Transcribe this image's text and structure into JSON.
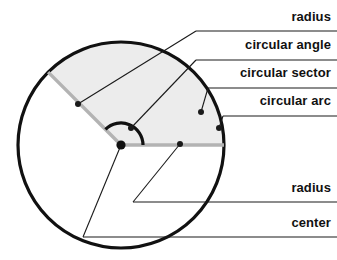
{
  "figure": {
    "type": "geometry-diagram",
    "background_color": "#ffffff"
  },
  "geometry": {
    "circle": {
      "center_x": 121,
      "center_y": 145,
      "radius": 103,
      "stroke_color": "#111111",
      "stroke_width": 3.2,
      "fill_color": "#ffffff"
    },
    "sector": {
      "fill_color": "#ececec",
      "start_angle_deg": 135,
      "end_angle_deg": 0,
      "radius_stroke_color": "#b3b3b3",
      "radius_stroke_width": 3.4
    },
    "angle_arc": {
      "radius": 22,
      "stroke_color": "#111111",
      "stroke_width": 3.2,
      "start_angle_deg": 135,
      "end_angle_deg": 0
    },
    "center_dot": {
      "x": 121,
      "y": 145,
      "r": 4.6,
      "color": "#111111"
    },
    "leader_color": "#1a1a1a",
    "leader_width": 1.1,
    "marker_dot_radius": 3.0
  },
  "labels": [
    {
      "id": "radius-upper",
      "text": "radius",
      "text_x": 331,
      "text_y": 10,
      "rule_y": 31,
      "rule_x1": 196,
      "rule_x2": 337,
      "anchor_x": 78,
      "anchor_y": 104
    },
    {
      "id": "circular-angle",
      "text": "circular angle",
      "text_x": 331,
      "text_y": 38,
      "rule_y": 60,
      "rule_x1": 196,
      "rule_x2": 337,
      "anchor_x": 131,
      "anchor_y": 128
    },
    {
      "id": "circular-sector",
      "text": "circular sector",
      "text_x": 331,
      "text_y": 66,
      "rule_y": 88,
      "rule_x1": 208,
      "rule_x2": 337,
      "anchor_x": 201,
      "anchor_y": 112
    },
    {
      "id": "circular-arc",
      "text": "circular arc",
      "text_x": 331,
      "text_y": 94,
      "rule_y": 116,
      "rule_x1": 223,
      "rule_x2": 337,
      "anchor_x": 219,
      "anchor_y": 128
    },
    {
      "id": "radius-lower",
      "text": "radius",
      "text_x": 331,
      "text_y": 181,
      "rule_y": 202,
      "rule_x1": 133,
      "rule_x2": 337,
      "anchor_x": 180,
      "anchor_y": 144
    },
    {
      "id": "center",
      "text": "center",
      "text_x": 331,
      "text_y": 216,
      "rule_y": 237,
      "rule_x1": 83,
      "rule_x2": 337,
      "anchor_x": 121,
      "anchor_y": 145
    }
  ]
}
